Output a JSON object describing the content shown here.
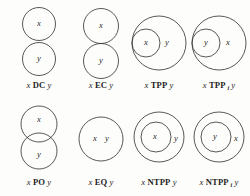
{
  "figure": {
    "name": "rcc8-base-relations",
    "stroke_color": "#3b3a38",
    "background_color": "#fdfdfc",
    "text_color": "#1f1e1c",
    "columns": 4,
    "rows": 2
  },
  "cells": [
    {
      "id": "dc",
      "relation": "DC",
      "subscript": "",
      "left_var": "x",
      "right_var": "y",
      "caption_prefix": "x",
      "caption_suffix": "y",
      "labels_in_diagram": [
        "x",
        "y"
      ],
      "layout": "two-disjoint-stacked"
    },
    {
      "id": "ec",
      "relation": "EC",
      "subscript": "",
      "left_var": "x",
      "right_var": "y",
      "caption_prefix": "x",
      "caption_suffix": "y",
      "labels_in_diagram": [
        "x",
        "y"
      ],
      "layout": "two-tangent-stacked"
    },
    {
      "id": "tpp",
      "relation": "TPP",
      "subscript": "",
      "left_var": "x",
      "right_var": "y",
      "caption_prefix": "x",
      "caption_suffix": "y",
      "labels_in_diagram": [
        "x",
        "y"
      ],
      "layout": "small-inside-tangent-left"
    },
    {
      "id": "tppi",
      "relation": "TPP",
      "subscript": "i",
      "left_var": "y",
      "right_var": "x",
      "caption_prefix": "x",
      "caption_suffix": "y",
      "labels_in_diagram": [
        "y",
        "x"
      ],
      "layout": "small-inside-tangent-left"
    },
    {
      "id": "po",
      "relation": "PO",
      "subscript": "",
      "left_var": "x",
      "right_var": "y",
      "caption_prefix": "x",
      "caption_suffix": "y",
      "labels_in_diagram": [
        "x",
        "y"
      ],
      "layout": "two-overlapping-stacked"
    },
    {
      "id": "eq",
      "relation": "EQ",
      "subscript": "",
      "left_var": "x",
      "right_var": "y",
      "caption_prefix": "x",
      "caption_suffix": "y",
      "labels_in_diagram": [
        "x",
        "y"
      ],
      "layout": "single-circle-two-labels"
    },
    {
      "id": "ntpp",
      "relation": "NTPP",
      "subscript": "",
      "left_var": "x",
      "right_var": "y",
      "caption_prefix": "x",
      "caption_suffix": "y",
      "labels_in_diagram": [
        "x",
        "y"
      ],
      "layout": "small-inside-nontangent"
    },
    {
      "id": "ntppi",
      "relation": "NTPP",
      "subscript": "i",
      "left_var": "y",
      "right_var": "x",
      "caption_prefix": "x",
      "caption_suffix": "y",
      "labels_in_diagram": [
        "y",
        "x"
      ],
      "layout": "small-inside-nontangent"
    }
  ]
}
